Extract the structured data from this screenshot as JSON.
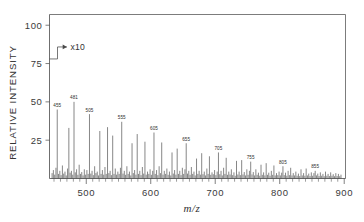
{
  "chart_data": {
    "type": "bar",
    "title": "",
    "subtitle": "",
    "xlabel": "m/z",
    "ylabel": "RELATIVE INTENSITY",
    "xlim": [
      443,
      902
    ],
    "ylim": [
      0,
      107
    ],
    "grid": false,
    "legend": null,
    "xticks": [
      500,
      600,
      700,
      800,
      900
    ],
    "xtick_labels": [
      "500",
      "600",
      "700",
      "800",
      "900"
    ],
    "xminor_tick_step": 10,
    "yticks": [
      25,
      50,
      75,
      100
    ],
    "ytick_labels": [
      "25",
      "50",
      "75",
      "100"
    ],
    "annotations": [
      {
        "text": "x10",
        "kind": "arrow-right",
        "x_data": 470,
        "y_data": 78
      }
    ],
    "labeled_peaks": [
      {
        "mz": 455,
        "intensity": 45,
        "label": "455"
      },
      {
        "mz": 481,
        "intensity": 50,
        "label": "481"
      },
      {
        "mz": 505,
        "intensity": 42,
        "label": "505"
      },
      {
        "mz": 555,
        "intensity": 37,
        "label": "555"
      },
      {
        "mz": 605,
        "intensity": 30,
        "label": "605"
      },
      {
        "mz": 655,
        "intensity": 23,
        "label": "655"
      },
      {
        "mz": 705,
        "intensity": 17,
        "label": "705"
      },
      {
        "mz": 755,
        "intensity": 11,
        "label": "755"
      },
      {
        "mz": 805,
        "intensity": 8,
        "label": "805"
      },
      {
        "mz": 855,
        "intensity": 5,
        "label": "855"
      }
    ],
    "series": [
      {
        "name": "mass spectrum",
        "x": [
          447,
          449,
          451,
          453,
          455,
          457,
          459,
          461,
          463,
          465,
          467,
          469,
          471,
          473,
          475,
          477,
          479,
          481,
          483,
          485,
          487,
          489,
          491,
          493,
          495,
          497,
          499,
          501,
          503,
          505,
          507,
          509,
          511,
          513,
          515,
          517,
          519,
          521,
          523,
          525,
          527,
          529,
          531,
          533,
          535,
          537,
          539,
          541,
          543,
          545,
          547,
          549,
          551,
          553,
          555,
          557,
          559,
          561,
          563,
          565,
          567,
          569,
          571,
          573,
          575,
          577,
          579,
          581,
          583,
          585,
          587,
          589,
          591,
          593,
          595,
          597,
          599,
          601,
          603,
          605,
          607,
          609,
          611,
          613,
          615,
          617,
          619,
          621,
          623,
          625,
          627,
          629,
          631,
          633,
          635,
          637,
          639,
          641,
          643,
          645,
          647,
          649,
          651,
          653,
          655,
          657,
          659,
          661,
          663,
          665,
          667,
          669,
          671,
          673,
          675,
          677,
          679,
          681,
          683,
          685,
          687,
          689,
          691,
          693,
          695,
          697,
          699,
          701,
          703,
          705,
          707,
          709,
          711,
          713,
          715,
          717,
          719,
          721,
          723,
          725,
          727,
          729,
          731,
          733,
          735,
          737,
          739,
          741,
          743,
          745,
          747,
          749,
          751,
          753,
          755,
          757,
          759,
          761,
          763,
          765,
          767,
          769,
          771,
          773,
          775,
          777,
          779,
          781,
          783,
          785,
          787,
          789,
          791,
          793,
          795,
          797,
          799,
          801,
          803,
          805,
          807,
          809,
          811,
          813,
          815,
          817,
          819,
          821,
          823,
          825,
          827,
          829,
          831,
          833,
          835,
          837,
          839,
          841,
          843,
          845,
          847,
          849,
          851,
          853,
          855,
          857,
          859,
          861,
          863,
          865,
          867,
          869,
          871,
          873,
          875,
          877,
          879,
          881,
          883,
          885,
          887,
          889,
          891,
          893,
          895
        ],
        "y": [
          3.5,
          5.5,
          2.5,
          7.0,
          45.0,
          3.0,
          5.0,
          2.2,
          8.5,
          3.2,
          4.5,
          2.0,
          6.5,
          33.0,
          3.8,
          5.0,
          2.5,
          50.0,
          4.0,
          6.0,
          2.4,
          9.0,
          3.0,
          4.2,
          2.0,
          6.0,
          2.5,
          5.5,
          3.0,
          42.0,
          3.2,
          5.0,
          2.2,
          8.0,
          3.5,
          4.5,
          2.0,
          31.0,
          3.0,
          5.5,
          2.5,
          7.5,
          3.0,
          33.5,
          3.5,
          5.0,
          2.2,
          28.0,
          3.0,
          6.5,
          2.5,
          4.5,
          3.0,
          7.0,
          37.0,
          3.2,
          5.0,
          2.4,
          8.0,
          3.0,
          4.5,
          2.0,
          23.0,
          3.5,
          5.5,
          2.5,
          29.0,
          3.0,
          5.0,
          2.2,
          7.5,
          3.2,
          24.0,
          2.5,
          4.5,
          3.0,
          6.0,
          2.4,
          5.0,
          30.0,
          3.0,
          5.5,
          2.2,
          8.0,
          3.5,
          23.5,
          2.5,
          5.0,
          3.0,
          6.5,
          2.4,
          4.5,
          2.0,
          17.0,
          3.2,
          5.5,
          2.5,
          19.5,
          3.0,
          5.0,
          2.2,
          7.0,
          3.0,
          6.0,
          23.0,
          3.2,
          5.0,
          2.4,
          7.5,
          3.0,
          4.5,
          2.0,
          13.0,
          3.0,
          5.0,
          2.5,
          16.5,
          2.8,
          4.5,
          2.0,
          6.5,
          3.0,
          14.5,
          2.4,
          4.0,
          2.8,
          5.5,
          2.2,
          4.5,
          17.0,
          2.8,
          5.0,
          2.0,
          7.0,
          3.0,
          13.5,
          2.4,
          4.5,
          2.6,
          6.0,
          2.2,
          4.0,
          1.8,
          11.5,
          2.6,
          4.5,
          2.2,
          12.0,
          2.6,
          4.2,
          2.0,
          6.0,
          2.4,
          5.0,
          11.0,
          2.6,
          4.2,
          2.0,
          6.0,
          2.4,
          3.8,
          1.8,
          9.0,
          2.4,
          4.0,
          2.0,
          10.0,
          2.4,
          3.8,
          1.8,
          5.0,
          2.4,
          8.5,
          2.0,
          3.5,
          2.2,
          4.5,
          2.0,
          3.8,
          8.0,
          2.2,
          3.8,
          1.8,
          5.0,
          2.2,
          7.0,
          2.0,
          3.5,
          2.0,
          4.5,
          1.8,
          3.2,
          1.6,
          6.0,
          2.0,
          3.5,
          1.8,
          6.5,
          2.0,
          3.2,
          1.6,
          4.0,
          1.8,
          3.5,
          5.0,
          2.0,
          3.2,
          1.6,
          4.0,
          1.8,
          3.0,
          1.5,
          4.5,
          1.8,
          3.0,
          1.6,
          4.0,
          1.8,
          2.8,
          1.5,
          3.5,
          1.6,
          3.0,
          1.5,
          2.5
        ]
      }
    ]
  }
}
